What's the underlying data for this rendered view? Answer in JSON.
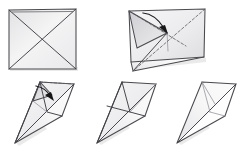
{
  "document": {
    "title": "Origami Folding Sequence",
    "medium": "pencil-sketch",
    "background_color": "#ffffff",
    "line_color": "#4a4a4e",
    "shading_color": "#d8d8da",
    "arrow_color": "#141416",
    "canvas": {
      "width": 250,
      "height": 149
    },
    "step_count": 5,
    "row_count": 2
  },
  "steps": [
    {
      "index": 1,
      "name": "square-with-diagonals",
      "row": "top",
      "column": "left",
      "caption": "",
      "shape": "square",
      "has_arrow": false,
      "has_dashed_crease": false,
      "creases": [
        "diagonal-top-left-to-bottom-right",
        "diagonal-top-right-to-bottom-left"
      ],
      "bbox": {
        "x": 8,
        "y": 9,
        "width": 68,
        "height": 60
      }
    },
    {
      "index": 2,
      "name": "square-folded-with-arrow",
      "row": "top",
      "column": "right",
      "caption": "",
      "shape": "square-in-perspective",
      "has_arrow": true,
      "arrow_type": "valley-fold-curved",
      "arrow_direction": "down-right",
      "has_dashed_crease": true,
      "creases": [
        "diagonal",
        "fold-line"
      ],
      "bbox": {
        "x": 128,
        "y": 8,
        "width": 78,
        "height": 62
      }
    },
    {
      "index": 3,
      "name": "kite-with-fold-arrow",
      "row": "bottom",
      "column": "left",
      "caption": "",
      "shape": "kite",
      "has_arrow": true,
      "arrow_type": "valley-fold-curved",
      "arrow_direction": "down-right",
      "has_dashed_crease": true,
      "creases": [
        "center-spine",
        "flap-edge"
      ],
      "bbox": {
        "x": 14,
        "y": 80,
        "width": 62,
        "height": 65
      }
    },
    {
      "index": 4,
      "name": "kite-folded",
      "row": "bottom",
      "column": "middle",
      "caption": "",
      "shape": "kite",
      "has_arrow": false,
      "has_dashed_crease": false,
      "creases": [
        "center-spine",
        "cross-creases"
      ],
      "bbox": {
        "x": 96,
        "y": 80,
        "width": 62,
        "height": 65
      }
    },
    {
      "index": 5,
      "name": "kite-finished",
      "row": "bottom",
      "column": "right",
      "caption": "",
      "shape": "kite",
      "has_arrow": false,
      "has_dashed_crease": false,
      "creases": [
        "center-spine",
        "short-crease"
      ],
      "bbox": {
        "x": 176,
        "y": 80,
        "width": 62,
        "height": 65
      }
    }
  ],
  "legend": {
    "solid_line": "paper edge",
    "dashed_line": "valley fold crease",
    "arrow": "fold direction"
  }
}
